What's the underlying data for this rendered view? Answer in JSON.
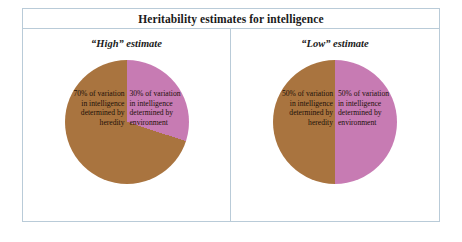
{
  "figure": {
    "title": "Heritability estimates for intelligence"
  },
  "panels": [
    {
      "heading": "“High” estimate",
      "heredity_label": "70% of variation in intelligence determined by heredity",
      "environment_label": "30% of variation in intelligence determined by environment"
    },
    {
      "heading": "“Low” estimate",
      "heredity_label": "50% of variation in intelligence determined by heredity",
      "environment_label": "50% of variation in intelligence determined by environment"
    }
  ],
  "colors": {
    "heredity": "#a9743f",
    "environment": "#c77bb3",
    "border": "#b9cbd8",
    "text": "#1a1a1a"
  },
  "chart_data": [
    {
      "type": "pie",
      "title": "“High” estimate",
      "categories": [
        "Heredity",
        "Environment"
      ],
      "values": [
        70,
        30
      ],
      "labels": [
        "70% of variation in intelligence determined by heredity",
        "30% of variation in intelligence determined by environment"
      ],
      "colors": [
        "#a9743f",
        "#c77bb3"
      ],
      "units": "percent",
      "start_angle_deg": 0,
      "direction": "clockwise",
      "legend": "none",
      "grid": false
    },
    {
      "type": "pie",
      "title": "“Low” estimate",
      "categories": [
        "Heredity",
        "Environment"
      ],
      "values": [
        50,
        50
      ],
      "labels": [
        "50% of variation in intelligence determined by heredity",
        "50% of variation in intelligence determined by environment"
      ],
      "colors": [
        "#a9743f",
        "#c77bb3"
      ],
      "units": "percent",
      "start_angle_deg": 0,
      "direction": "clockwise",
      "legend": "none",
      "grid": false
    }
  ]
}
